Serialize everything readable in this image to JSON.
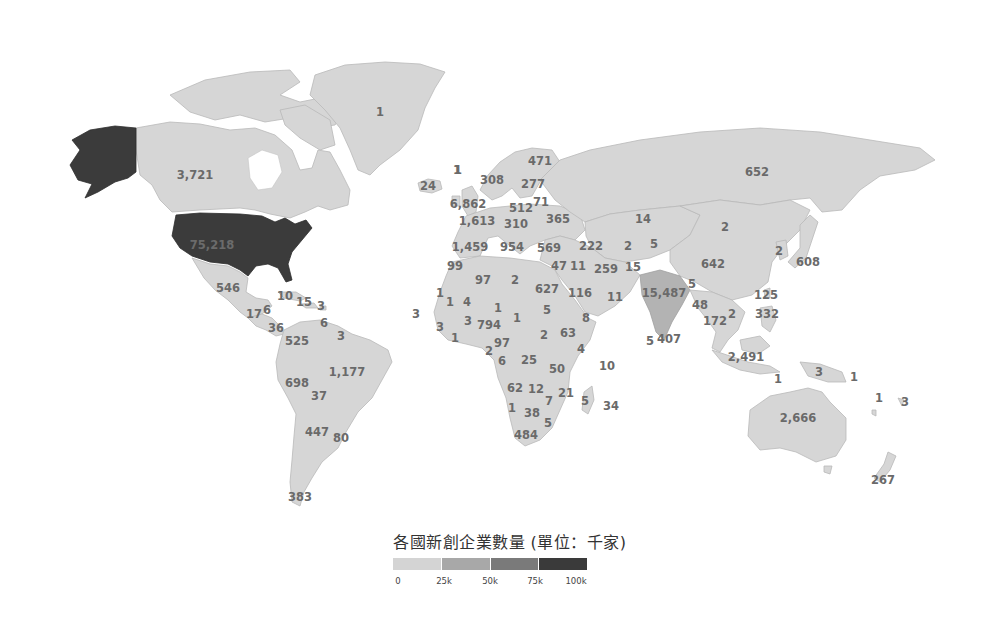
{
  "chart_data": {
    "type": "choropleth-map",
    "title": "各國新創企業數量 (單位：千家)",
    "unit": "千家",
    "legend": {
      "ticks": [
        "0",
        "25k",
        "50k",
        "75k",
        "100k"
      ],
      "colors": [
        "#d4d4d4",
        "#a8a8a8",
        "#7a7a7a",
        "#3a3a3a"
      ]
    },
    "regions": [
      {
        "name": "United States",
        "value": "75,218",
        "x": 212,
        "y": 246,
        "dark": true
      },
      {
        "name": "Canada",
        "value": "3,721",
        "x": 195,
        "y": 176
      },
      {
        "name": "Greenland",
        "value": "1",
        "x": 380,
        "y": 113
      },
      {
        "name": "Iceland",
        "value": "24",
        "x": 428,
        "y": 187
      },
      {
        "name": "Faroe Islands",
        "value": "1",
        "x": 458,
        "y": 171
      },
      {
        "name": "Mexico",
        "value": "546",
        "x": 228,
        "y": 289
      },
      {
        "name": "Cuba",
        "value": "10",
        "x": 285,
        "y": 297
      },
      {
        "name": "Haiti",
        "value": "15",
        "x": 304,
        "y": 303
      },
      {
        "name": "Puerto Rico",
        "value": "3",
        "x": 321,
        "y": 307
      },
      {
        "name": "Guatemala",
        "value": "17",
        "x": 254,
        "y": 315
      },
      {
        "name": "Honduras",
        "value": "6",
        "x": 267,
        "y": 311
      },
      {
        "name": "Panama",
        "value": "36",
        "x": 276,
        "y": 329
      },
      {
        "name": "Trinidad",
        "value": "6",
        "x": 324,
        "y": 324
      },
      {
        "name": "Guyana",
        "value": "3",
        "x": 341,
        "y": 337
      },
      {
        "name": "Colombia",
        "value": "525",
        "x": 297,
        "y": 342
      },
      {
        "name": "Peru",
        "value": "698",
        "x": 297,
        "y": 384
      },
      {
        "name": "Brazil",
        "value": "1,177",
        "x": 347,
        "y": 373
      },
      {
        "name": "Bolivia",
        "value": "37",
        "x": 319,
        "y": 397
      },
      {
        "name": "Argentina",
        "value": "447",
        "x": 317,
        "y": 433
      },
      {
        "name": "Uruguay",
        "value": "80",
        "x": 341,
        "y": 439
      },
      {
        "name": "Chile",
        "value": "383",
        "x": 300,
        "y": 498
      },
      {
        "name": "Cape Verde",
        "value": "3",
        "x": 416,
        "y": 315
      },
      {
        "name": "Ireland",
        "value": "1",
        "x": 457,
        "y": 171
      },
      {
        "name": "Norway",
        "value": "308",
        "x": 492,
        "y": 181
      },
      {
        "name": "Finland",
        "value": "471",
        "x": 540,
        "y": 162
      },
      {
        "name": "Sweden",
        "value": "277",
        "x": 533,
        "y": 185
      },
      {
        "name": "United Kingdom",
        "value": "6,862",
        "x": 468,
        "y": 205
      },
      {
        "name": "Poland",
        "value": "512",
        "x": 521,
        "y": 209
      },
      {
        "name": "Belarus",
        "value": "71",
        "x": 541,
        "y": 203
      },
      {
        "name": "France",
        "value": "1,613",
        "x": 477,
        "y": 222
      },
      {
        "name": "Germany",
        "value": "310",
        "x": 516,
        "y": 225
      },
      {
        "name": "Ukraine",
        "value": "365",
        "x": 558,
        "y": 220
      },
      {
        "name": "Kazakhstan",
        "value": "14",
        "x": 643,
        "y": 220
      },
      {
        "name": "Spain",
        "value": "1,459",
        "x": 470,
        "y": 248
      },
      {
        "name": "Italy",
        "value": "954",
        "x": 512,
        "y": 248
      },
      {
        "name": "Turkey",
        "value": "569",
        "x": 549,
        "y": 249
      },
      {
        "name": "Azerbaijan",
        "value": "222",
        "x": 591,
        "y": 247
      },
      {
        "name": "Uzbekistan",
        "value": "2",
        "x": 628,
        "y": 247
      },
      {
        "name": "Kyrgyzstan",
        "value": "5",
        "x": 654,
        "y": 245
      },
      {
        "name": "Morocco",
        "value": "99",
        "x": 455,
        "y": 267
      },
      {
        "name": "Syria/Lebanon",
        "value": "47",
        "x": 559,
        "y": 267
      },
      {
        "name": "Iraq",
        "value": "11",
        "x": 578,
        "y": 267
      },
      {
        "name": "Iran",
        "value": "259",
        "x": 606,
        "y": 270
      },
      {
        "name": "Afghanistan",
        "value": "15",
        "x": 633,
        "y": 268
      },
      {
        "name": "Algeria",
        "value": "97",
        "x": 483,
        "y": 281
      },
      {
        "name": "Libya",
        "value": "2",
        "x": 515,
        "y": 281
      },
      {
        "name": "Egypt",
        "value": "627",
        "x": 547,
        "y": 290
      },
      {
        "name": "Saudi Arabia",
        "value": "116",
        "x": 580,
        "y": 294
      },
      {
        "name": "Oman",
        "value": "11",
        "x": 615,
        "y": 298
      },
      {
        "name": "India",
        "value": "15,487",
        "x": 664,
        "y": 294
      },
      {
        "name": "Russia",
        "value": "652",
        "x": 757,
        "y": 173
      },
      {
        "name": "Mongolia",
        "value": "2",
        "x": 725,
        "y": 228
      },
      {
        "name": "China",
        "value": "642",
        "x": 713,
        "y": 265
      },
      {
        "name": "South Korea",
        "value": "2",
        "x": 779,
        "y": 252
      },
      {
        "name": "Japan",
        "value": "608",
        "x": 808,
        "y": 263
      },
      {
        "name": "Bangladesh",
        "value": "5",
        "x": 692,
        "y": 285
      },
      {
        "name": "Myanmar",
        "value": "48",
        "x": 700,
        "y": 306
      },
      {
        "name": "Taiwan",
        "value": "125",
        "x": 766,
        "y": 296
      },
      {
        "name": "Thailand",
        "value": "172",
        "x": 715,
        "y": 322
      },
      {
        "name": "Vietnam",
        "value": "2",
        "x": 732,
        "y": 315
      },
      {
        "name": "Philippines",
        "value": "332",
        "x": 767,
        "y": 315
      },
      {
        "name": "Sri Lanka",
        "value": "5",
        "x": 650,
        "y": 342
      },
      {
        "name": "Maldives/Sri Lanka",
        "value": "407",
        "x": 669,
        "y": 340
      },
      {
        "name": "Indonesia",
        "value": "2,491",
        "x": 746,
        "y": 358
      },
      {
        "name": "Timor-Leste",
        "value": "1",
        "x": 778,
        "y": 380
      },
      {
        "name": "Papua New Guinea",
        "value": "3",
        "x": 819,
        "y": 373
      },
      {
        "name": "Solomon Islands",
        "value": "1",
        "x": 854,
        "y": 378
      },
      {
        "name": "Vanuatu",
        "value": "1",
        "x": 879,
        "y": 399
      },
      {
        "name": "Fiji",
        "value": "3",
        "x": 905,
        "y": 403
      },
      {
        "name": "Australia",
        "value": "2,666",
        "x": 798,
        "y": 419
      },
      {
        "name": "New Zealand",
        "value": "267",
        "x": 883,
        "y": 481
      },
      {
        "name": "Senegal",
        "value": "1",
        "x": 440,
        "y": 294
      },
      {
        "name": "Mali-W",
        "value": "1",
        "x": 450,
        "y": 303
      },
      {
        "name": "Mali",
        "value": "4",
        "x": 467,
        "y": 303
      },
      {
        "name": "Niger",
        "value": "1",
        "x": 498,
        "y": 309
      },
      {
        "name": "Chad",
        "value": "1",
        "x": 517,
        "y": 319
      },
      {
        "name": "Sudan",
        "value": "5",
        "x": 547,
        "y": 311
      },
      {
        "name": "Eritrea",
        "value": "8",
        "x": 586,
        "y": 319
      },
      {
        "name": "Guinea",
        "value": "3",
        "x": 440,
        "y": 328
      },
      {
        "name": "Burkina Faso",
        "value": "3",
        "x": 468,
        "y": 322
      },
      {
        "name": "Nigeria",
        "value": "794",
        "x": 489,
        "y": 326
      },
      {
        "name": "Sierra Leone",
        "value": "1",
        "x": 455,
        "y": 339
      },
      {
        "name": "South Sudan",
        "value": "2",
        "x": 544,
        "y": 336
      },
      {
        "name": "Ethiopia",
        "value": "63",
        "x": 568,
        "y": 334
      },
      {
        "name": "Cameroon",
        "value": "97",
        "x": 502,
        "y": 344
      },
      {
        "name": "Gabon",
        "value": "2",
        "x": 489,
        "y": 352
      },
      {
        "name": "Somalia",
        "value": "4",
        "x": 581,
        "y": 350
      },
      {
        "name": "Congo",
        "value": "6",
        "x": 502,
        "y": 362
      },
      {
        "name": "DR Congo",
        "value": "25",
        "x": 529,
        "y": 361
      },
      {
        "name": "Seychelles",
        "value": "10",
        "x": 607,
        "y": 367
      },
      {
        "name": "Tanzania",
        "value": "50",
        "x": 557,
        "y": 370
      },
      {
        "name": "Angola",
        "value": "62",
        "x": 515,
        "y": 389
      },
      {
        "name": "Zambia",
        "value": "12",
        "x": 536,
        "y": 390
      },
      {
        "name": "Mozambique",
        "value": "21",
        "x": 566,
        "y": 394
      },
      {
        "name": "Malawi",
        "value": "7",
        "x": 549,
        "y": 402
      },
      {
        "name": "Madagascar",
        "value": "5",
        "x": 585,
        "y": 402
      },
      {
        "name": "Mauritius",
        "value": "34",
        "x": 611,
        "y": 407
      },
      {
        "name": "Namibia",
        "value": "1",
        "x": 512,
        "y": 409
      },
      {
        "name": "Botswana",
        "value": "38",
        "x": 532,
        "y": 414
      },
      {
        "name": "Swaziland",
        "value": "5",
        "x": 548,
        "y": 424
      },
      {
        "name": "South Africa",
        "value": "484",
        "x": 526,
        "y": 436
      }
    ]
  }
}
